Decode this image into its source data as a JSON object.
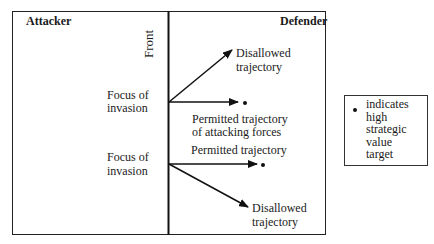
{
  "diagram": {
    "left_region_label": "Attacker",
    "right_region_label": "Defender",
    "boundary_label": "Front",
    "upper": {
      "focus_label_line1": "Focus of",
      "focus_label_line2": "invasion",
      "disallowed_line1": "Disallowed",
      "disallowed_line2": "trajectory",
      "permitted_line1": "Permitted trajectory",
      "permitted_line2": "of attacking forces"
    },
    "lower": {
      "focus_label_line1": "Focus of",
      "focus_label_line2": "invasion",
      "permitted_label": "Permitted trajectory",
      "disallowed_line1": "Disallowed",
      "disallowed_line2": "trajectory"
    },
    "legend": {
      "symbol": "dot",
      "text": "indicates high strategic value target",
      "lines": [
        "indicates",
        "high",
        "strategic",
        "value",
        "target"
      ]
    },
    "colors": {
      "line": "#111111",
      "background": "#ffffff"
    }
  }
}
